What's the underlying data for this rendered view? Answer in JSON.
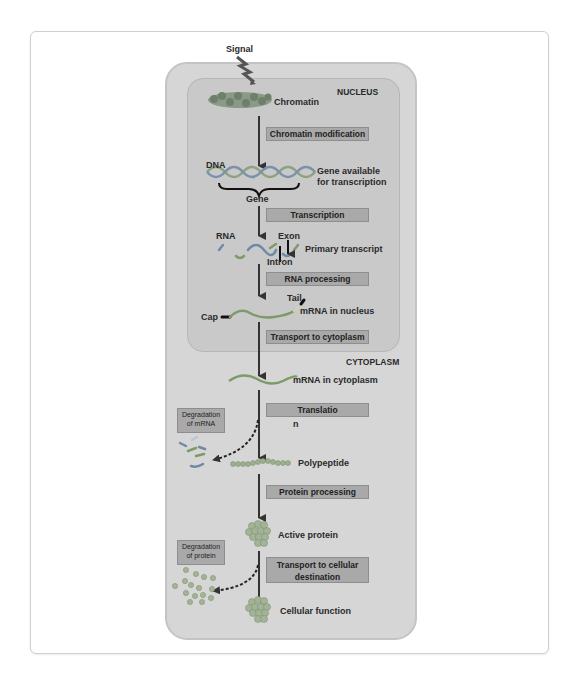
{
  "diagram": {
    "signal_label": "Signal",
    "compartments": {
      "nucleus": "NUCLEUS",
      "cytoplasm": "CYTOPLASM"
    },
    "states": {
      "chromatin": "Chromatin",
      "dna": "DNA",
      "gene_available_line1": "Gene available",
      "gene_available_line2": "for transcription",
      "gene": "Gene",
      "rna": "RNA",
      "exon": "Exon",
      "intron": "Intron",
      "primary_transcript": "Primary transcript",
      "tail": "Tail",
      "cap": "Cap",
      "mrna_nucleus": "mRNA in nucleus",
      "mrna_cytoplasm": "mRNA in cytoplasm",
      "polypeptide": "Polypeptide",
      "active_protein": "Active protein",
      "cellular_function": "Cellular function"
    },
    "steps": [
      {
        "label": "Chromatin modification"
      },
      {
        "label": "Transcription"
      },
      {
        "label": "RNA processing"
      },
      {
        "label": "Transport to cytoplasm"
      },
      {
        "label": "Translatio",
        "label_overflow": "n"
      },
      {
        "label": "Protein processing"
      },
      {
        "label": "Transport to cellular",
        "label_line2": "destination"
      }
    ],
    "degradation": [
      {
        "line1": "Degradation",
        "line2": "of mRNA"
      },
      {
        "line1": "Degradation",
        "line2": "of protein"
      }
    ],
    "colors": {
      "cell_fill": "#d6d6d6",
      "nucleus_fill": "#c9c9c9",
      "step_box": "#a9a9a9",
      "arrow": "#333333",
      "strand_green": "#7f9a6a",
      "strand_blue": "#6f8aa8"
    }
  }
}
